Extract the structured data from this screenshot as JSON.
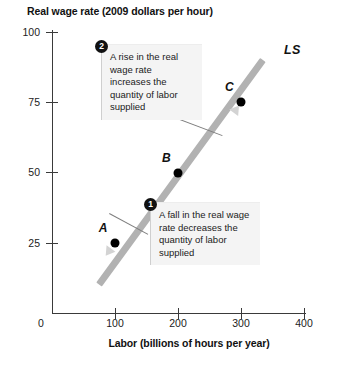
{
  "chart_data": {
    "type": "line",
    "title": "",
    "ylabel": "Real wage rate (2009 dollars per hour)",
    "xlabel": "Labor (billions of hours per year)",
    "xlim": [
      0,
      400
    ],
    "ylim": [
      0,
      100
    ],
    "xticks": [
      "0",
      "100",
      "200",
      "300",
      "400"
    ],
    "yticks": [
      "25",
      "50",
      "75",
      "100"
    ],
    "grid": false,
    "legend": "none",
    "series": [
      {
        "name": "LS",
        "label": "LS",
        "description": "Labor supply curve, upward sloping",
        "color": "#b2b2b2",
        "x": [
          75,
          335
        ],
        "y": [
          10,
          90
        ]
      }
    ],
    "points": [
      {
        "label": "A",
        "x": 100,
        "y": 25
      },
      {
        "label": "B",
        "x": 200,
        "y": 50
      },
      {
        "label": "C",
        "x": 300,
        "y": 75
      }
    ],
    "annotations": [
      {
        "marker": "2",
        "text": "A rise in the real wage rate increases the quantity of labor supplied",
        "points_to": "C"
      },
      {
        "marker": "1",
        "text": "A fall in the real wage rate decreases the quantity of labor supplied",
        "points_to": "A"
      }
    ]
  },
  "colors": {
    "curve": "#b2b2b2",
    "point": "#000000",
    "axis": "#3a3a3a",
    "callout_bg": "#f4f4f4",
    "marker_bg": "#111111"
  }
}
